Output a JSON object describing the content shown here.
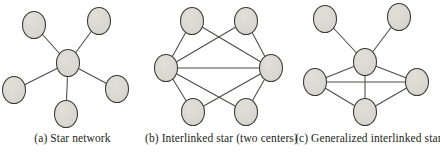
{
  "figure": {
    "background_color": "#ffffff",
    "node_fill_color": "#d5d5cd",
    "node_stroke_color": "#3a3a36",
    "edge_color": "#4a4a46",
    "caption_color": "#231f20"
  },
  "panels": [
    {
      "id": "a",
      "caption": "(a) Star network",
      "node_count": 6,
      "edge_count": 5,
      "nodes": [
        {
          "id": "center",
          "label": "center",
          "cx": 68,
          "cy": 63,
          "rx": 11.5,
          "ry": 13.5
        },
        {
          "id": "n1",
          "label": "top-left leaf",
          "cx": 34,
          "cy": 25,
          "rx": 11.5,
          "ry": 13.5
        },
        {
          "id": "n2",
          "label": "top-right leaf",
          "cx": 99,
          "cy": 21,
          "rx": 11.5,
          "ry": 13.5
        },
        {
          "id": "n3",
          "label": "left leaf",
          "cx": 14,
          "cy": 90,
          "rx": 11.5,
          "ry": 13.5
        },
        {
          "id": "n4",
          "label": "bottom leaf",
          "cx": 66,
          "cy": 114,
          "rx": 11.5,
          "ry": 13.5
        },
        {
          "id": "n5",
          "label": "right leaf",
          "cx": 117,
          "cy": 89,
          "rx": 11.5,
          "ry": 13.5
        }
      ],
      "edges": [
        {
          "from": "center",
          "to": "n1"
        },
        {
          "from": "center",
          "to": "n2"
        },
        {
          "from": "center",
          "to": "n3"
        },
        {
          "from": "center",
          "to": "n4"
        },
        {
          "from": "center",
          "to": "n5"
        }
      ]
    },
    {
      "id": "b",
      "caption": "(b)  Interlinked star (two centers)",
      "node_count": 6,
      "edge_count": 9,
      "nodes": [
        {
          "id": "cL",
          "label": "left center",
          "cx": 21,
          "cy": 68,
          "rx": 11.5,
          "ry": 13.5
        },
        {
          "id": "cR",
          "label": "right center",
          "cx": 126,
          "cy": 68,
          "rx": 11.5,
          "ry": 13.5
        },
        {
          "id": "p1",
          "label": "top-left node",
          "cx": 47,
          "cy": 21,
          "rx": 11.5,
          "ry": 13.5
        },
        {
          "id": "p2",
          "label": "top-right node",
          "cx": 101,
          "cy": 21,
          "rx": 11.5,
          "ry": 13.5
        },
        {
          "id": "p3",
          "label": "bottom-left node",
          "cx": 48,
          "cy": 112,
          "rx": 11.5,
          "ry": 13.5
        },
        {
          "id": "p4",
          "label": "bottom-right node",
          "cx": 101,
          "cy": 112,
          "rx": 11.5,
          "ry": 13.5
        }
      ],
      "edges": [
        {
          "from": "cL",
          "to": "cR"
        },
        {
          "from": "cL",
          "to": "p1"
        },
        {
          "from": "cL",
          "to": "p2"
        },
        {
          "from": "cL",
          "to": "p3"
        },
        {
          "from": "cL",
          "to": "p4"
        },
        {
          "from": "cR",
          "to": "p1"
        },
        {
          "from": "cR",
          "to": "p2"
        },
        {
          "from": "cR",
          "to": "p3"
        },
        {
          "from": "cR",
          "to": "p4"
        }
      ]
    },
    {
      "id": "c",
      "caption": "(c) Generalized interlinked star",
      "node_count": 6,
      "edge_count": 8,
      "nodes": [
        {
          "id": "hub",
          "label": "hub",
          "cx": 70,
          "cy": 62,
          "rx": 11.5,
          "ry": 13.5
        },
        {
          "id": "t1",
          "label": "top-left pendant",
          "cx": 30,
          "cy": 19,
          "rx": 11.5,
          "ry": 13.5
        },
        {
          "id": "t2",
          "label": "top-right pendant",
          "cx": 104,
          "cy": 17,
          "rx": 11.5,
          "ry": 13.5
        },
        {
          "id": "left",
          "label": "left node",
          "cx": 20,
          "cy": 82,
          "rx": 11.5,
          "ry": 13.5
        },
        {
          "id": "right",
          "label": "right node",
          "cx": 122,
          "cy": 82,
          "rx": 11.5,
          "ry": 13.5
        },
        {
          "id": "bottom",
          "label": "bottom node",
          "cx": 70,
          "cy": 112,
          "rx": 11.5,
          "ry": 13.5
        }
      ],
      "edges": [
        {
          "from": "hub",
          "to": "t1"
        },
        {
          "from": "hub",
          "to": "t2"
        },
        {
          "from": "hub",
          "to": "left"
        },
        {
          "from": "hub",
          "to": "right"
        },
        {
          "from": "hub",
          "to": "bottom"
        },
        {
          "from": "left",
          "to": "right"
        },
        {
          "from": "left",
          "to": "bottom"
        },
        {
          "from": "bottom",
          "to": "right"
        }
      ]
    }
  ]
}
